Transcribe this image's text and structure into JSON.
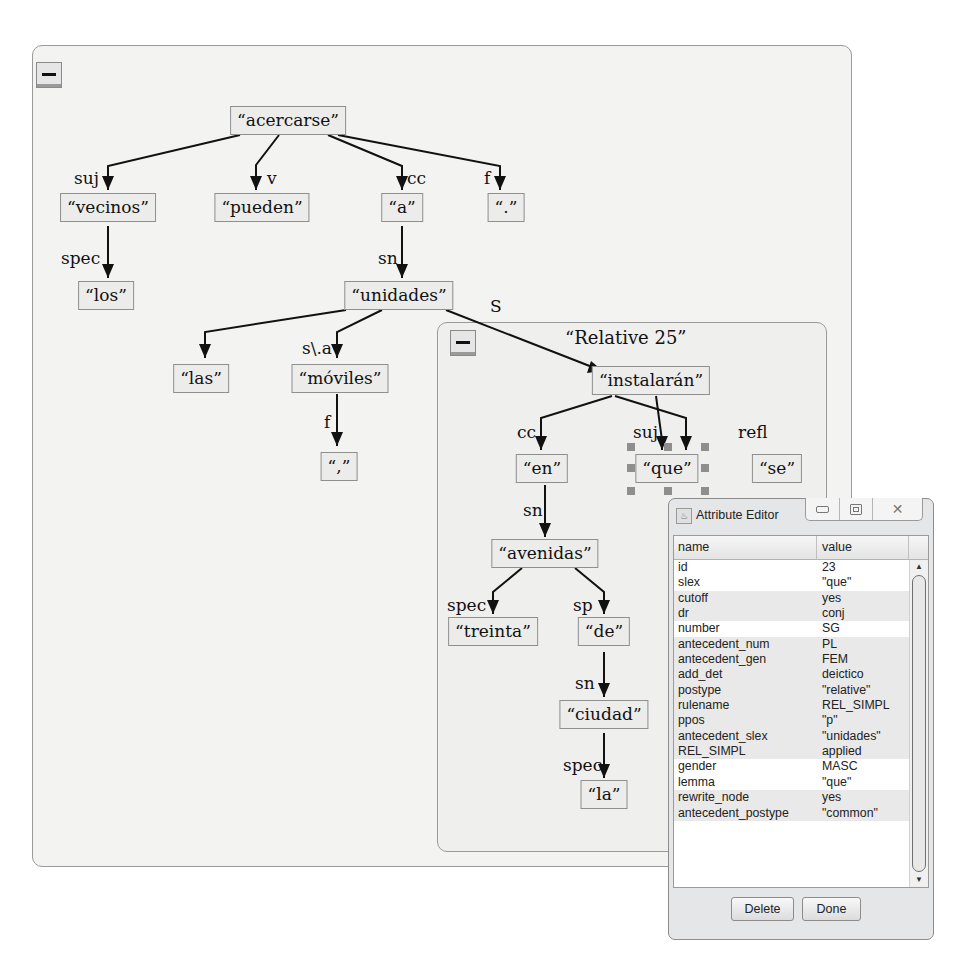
{
  "main_panel": {
    "collapse_label": "collapse",
    "nodes": {
      "acercarse": "“acercarse”",
      "vecinos": "“vecinos”",
      "pueden": "“pueden”",
      "a": "“a”",
      "period": "“.”",
      "los": "“los”",
      "unidades": "“unidades”",
      "las": "“las”",
      "moviles": "“móviles”",
      "comma": "“,”"
    },
    "edge_labels": {
      "suj": "suj",
      "v": "v",
      "cc": "cc",
      "f": "f",
      "spec": "spec",
      "sn": "sn",
      "s_a": "s\\.a",
      "f2": "f",
      "S": "S"
    }
  },
  "relative_panel": {
    "title": "“Relative 25”",
    "nodes": {
      "instalaran": "“instalarán”",
      "en": "“en”",
      "que": "“que”",
      "se": "“se”",
      "avenidas": "“avenidas”",
      "treinta": "“treinta”",
      "de": "“de”",
      "ciudad": "“ciudad”",
      "la": "“la”"
    },
    "edge_labels": {
      "cc": "cc",
      "suj": "suj",
      "refl": "refl",
      "sn": "sn",
      "spec": "spec",
      "sp": "sp",
      "sn2": "sn",
      "spec2": "spec"
    },
    "selected_node": "que"
  },
  "attribute_editor": {
    "title": "Attribute Editor",
    "window_buttons": {
      "minimize": "minimize",
      "maximize": "maximize",
      "close": "close"
    },
    "columns": [
      "name",
      "value"
    ],
    "rows": [
      {
        "name": "id",
        "value": "23",
        "shaded": false
      },
      {
        "name": "slex",
        "value": "\"que\"",
        "shaded": false
      },
      {
        "name": "cutoff",
        "value": "yes",
        "shaded": true
      },
      {
        "name": "dr",
        "value": "conj",
        "shaded": true
      },
      {
        "name": "number",
        "value": "SG",
        "shaded": false
      },
      {
        "name": "antecedent_num",
        "value": "PL",
        "shaded": true
      },
      {
        "name": "antecedent_gen",
        "value": "FEM",
        "shaded": true
      },
      {
        "name": "add_det",
        "value": "deictico",
        "shaded": true
      },
      {
        "name": "postype",
        "value": "\"relative\"",
        "shaded": true
      },
      {
        "name": "rulename",
        "value": "REL_SIMPL",
        "shaded": true
      },
      {
        "name": "ppos",
        "value": "\"p\"",
        "shaded": true
      },
      {
        "name": "antecedent_slex",
        "value": "\"unidades\"",
        "shaded": true
      },
      {
        "name": "REL_SIMPL",
        "value": "applied",
        "shaded": true
      },
      {
        "name": "gender",
        "value": "MASC",
        "shaded": false
      },
      {
        "name": "lemma",
        "value": "\"que\"",
        "shaded": false
      },
      {
        "name": "rewrite_node",
        "value": "yes",
        "shaded": true
      },
      {
        "name": "antecedent_postype",
        "value": "\"common\"",
        "shaded": true
      }
    ],
    "buttons": {
      "delete": "Delete",
      "done": "Done"
    }
  }
}
